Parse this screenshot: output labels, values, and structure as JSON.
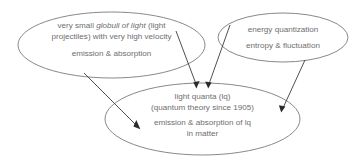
{
  "diagram": {
    "type": "concept-map",
    "background_color": "#ffffff",
    "node_stroke_color": "#7a7a7a",
    "text_color": "#6e6e6e",
    "edge_color": "#3b3b3b",
    "nodes": [
      {
        "id": "globuli",
        "shape": "ellipse",
        "lines": [
          "very small globuli of light (light",
          "projectiles) with very high velocity",
          "emission & absorption"
        ],
        "line1_prefix": "very small ",
        "line1_italic": "globuli of light",
        "line1_suffix": " (light",
        "line2": "projectiles) with very high velocity",
        "line3": "emission & absorption"
      },
      {
        "id": "quantization",
        "shape": "ellipse",
        "lines": [
          "energy quantization",
          "entropy & fluctuation"
        ],
        "line1": "energy quantization",
        "line2": "entropy & fluctuation"
      },
      {
        "id": "light-quanta",
        "shape": "ellipse",
        "lines": [
          "light quanta (lq)",
          "(quantum theory since 1905)",
          "emission & absorption of lq",
          "in matter"
        ],
        "line1": "light quanta (lq)",
        "line2": "(quantum theory since 1905)",
        "line3": "emission & absorption of lq",
        "line4": "in matter"
      }
    ],
    "edges": [
      {
        "id": "edge-globuli-to-lq-top",
        "from": "globuli",
        "to": "light-quanta"
      },
      {
        "id": "edge-quantization-to-lq-top",
        "from": "quantization",
        "to": "light-quanta"
      },
      {
        "id": "edge-globuli-to-lq-emission",
        "from": "globuli",
        "to": "light-quanta"
      },
      {
        "id": "edge-quantization-to-lq-right",
        "from": "quantization",
        "to": "light-quanta"
      }
    ]
  }
}
